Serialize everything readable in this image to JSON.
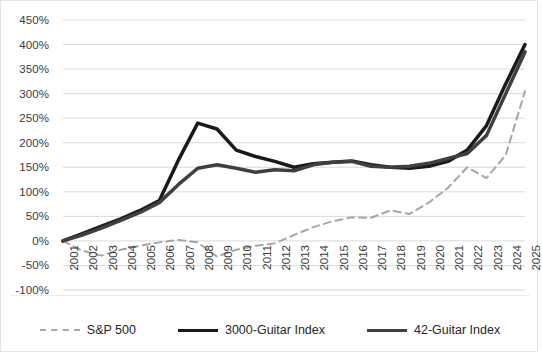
{
  "chart_data": {
    "type": "line",
    "title": "",
    "xlabel": "",
    "ylabel": "",
    "ylim": [
      -100,
      450
    ],
    "ytick_step": 50,
    "grid": true,
    "legend_position": "bottom",
    "ytick_labels": [
      "450%",
      "400%",
      "350%",
      "300%",
      "250%",
      "200%",
      "150%",
      "100%",
      "50%",
      "0%",
      "-50%",
      "-100%"
    ],
    "ytick_values": [
      450,
      400,
      350,
      300,
      250,
      200,
      150,
      100,
      50,
      0,
      -50,
      -100
    ],
    "categories": [
      "2001",
      "2002",
      "2003",
      "2004",
      "2005",
      "2006",
      "2007",
      "2008",
      "2009",
      "2010",
      "2011",
      "2012",
      "2013",
      "2014",
      "2015",
      "2016",
      "2017",
      "2018",
      "2019",
      "2020",
      "2021",
      "2022",
      "2023",
      "2024",
      "2025"
    ],
    "series": [
      {
        "name": "S&P 500",
        "style": "dashed",
        "color": "#a6a6a6",
        "width": 2,
        "values": [
          0,
          -20,
          -30,
          -18,
          -10,
          -3,
          2,
          -3,
          -32,
          -18,
          -10,
          -5,
          12,
          28,
          40,
          48,
          47,
          62,
          55,
          78,
          108,
          150,
          128,
          175,
          305
        ]
      },
      {
        "name": "3000-Guitar Index",
        "style": "solid",
        "color": "#1a1a1a",
        "width": 3.5,
        "values": [
          0,
          15,
          30,
          45,
          62,
          82,
          165,
          240,
          228,
          185,
          172,
          162,
          150,
          157,
          160,
          163,
          155,
          150,
          148,
          152,
          162,
          185,
          235,
          320,
          400
        ]
      },
      {
        "name": "42-Guitar Index",
        "style": "solid",
        "color": "#3f3f3f",
        "width": 3.5,
        "values": [
          0,
          12,
          26,
          42,
          58,
          78,
          115,
          148,
          155,
          148,
          140,
          145,
          143,
          155,
          160,
          162,
          152,
          150,
          152,
          158,
          168,
          178,
          215,
          300,
          385
        ]
      }
    ]
  },
  "legend": {
    "items": [
      {
        "label": "S&P 500",
        "style": "dashed",
        "color": "#a6a6a6"
      },
      {
        "label": "3000-Guitar Index",
        "style": "solid",
        "color": "#1a1a1a"
      },
      {
        "label": "42-Guitar Index",
        "style": "solid",
        "color": "#3f3f3f"
      }
    ]
  }
}
